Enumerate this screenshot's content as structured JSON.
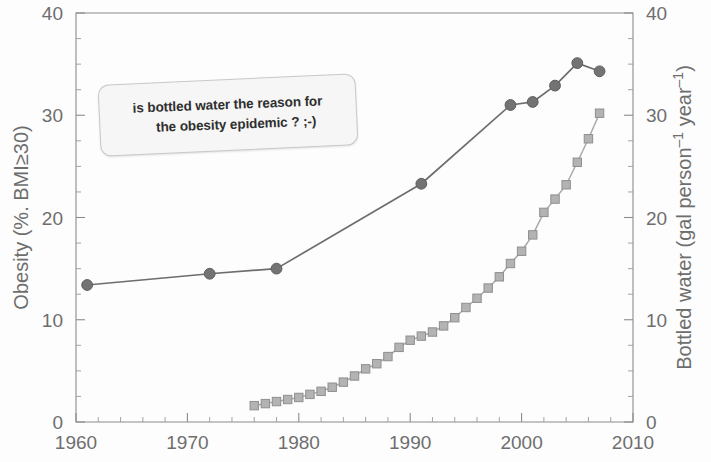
{
  "chart_data": {
    "type": "line",
    "title": "",
    "subtitle": "",
    "xlabel": "",
    "ylabel": "Obesity (%. BMI≥30)",
    "y2label_parts": {
      "prefix": "Bottled water (gal person",
      "exp1": "–1",
      "middle": " year",
      "exp2": "–1",
      "suffix": ")"
    },
    "y2label": "Bottled water (gal person–1 year–1)",
    "xlim": [
      1960,
      2010
    ],
    "ylim": [
      0,
      40
    ],
    "y2lim": [
      0,
      40
    ],
    "x_major_ticks": [
      1960,
      1970,
      1980,
      1990,
      2000,
      2010
    ],
    "x_major_tick_labels": [
      "1960",
      "1970",
      "1980",
      "1990",
      "2000",
      "2010"
    ],
    "x_minor_tick_step": 2,
    "y_major_ticks": [
      0,
      10,
      20,
      30,
      40
    ],
    "y_major_tick_labels": [
      "0",
      "10",
      "20",
      "30",
      "40"
    ],
    "y2_major_ticks": [
      0,
      10,
      20,
      30,
      40
    ],
    "y2_major_tick_labels": [
      "0",
      "10",
      "20",
      "30",
      "40"
    ],
    "y_minor_tick_step": 2.5,
    "grid": false,
    "legend_position": "none",
    "series": [
      {
        "name": "Obesity (%. BMI≥30)",
        "axis": "left",
        "marker": "circle",
        "color": "#737373",
        "line_color": "#6d6d6d",
        "x": [
          1961,
          1972,
          1978,
          1991,
          1999,
          2001,
          2003,
          2005,
          2007
        ],
        "values": [
          13.4,
          14.5,
          15.0,
          23.3,
          31.0,
          31.3,
          32.9,
          35.1,
          34.3
        ]
      },
      {
        "name": "Bottled water (gal person–1 year–1)",
        "axis": "right",
        "marker": "square",
        "color": "#b3b3b3",
        "line_color": "#a9a9a9",
        "x": [
          1976,
          1977,
          1978,
          1979,
          1980,
          1981,
          1982,
          1983,
          1984,
          1985,
          1986,
          1987,
          1988,
          1989,
          1990,
          1991,
          1992,
          1993,
          1994,
          1995,
          1996,
          1997,
          1998,
          1999,
          2000,
          2001,
          2002,
          2003,
          2004,
          2005,
          2006,
          2007
        ],
        "values": [
          1.6,
          1.8,
          2.0,
          2.2,
          2.4,
          2.7,
          3.0,
          3.4,
          3.9,
          4.5,
          5.2,
          5.7,
          6.4,
          7.3,
          8.0,
          8.4,
          8.8,
          9.4,
          10.2,
          11.2,
          12.1,
          13.1,
          14.2,
          15.5,
          16.7,
          18.3,
          20.5,
          21.8,
          23.2,
          25.4,
          27.7,
          30.2
        ]
      }
    ],
    "annotations": [
      {
        "id": "callout",
        "line1": "is bottled water the reason for",
        "line2": "the obesity epidemic ? ;-)"
      }
    ],
    "colors": {
      "obesity": "#737373",
      "bottled_water": "#b3b3b3",
      "axis": "#8c8c8c",
      "text": "#6e6e6e",
      "callout_background": "#f6f6f6",
      "callout_border": "#c9c9c9"
    }
  }
}
